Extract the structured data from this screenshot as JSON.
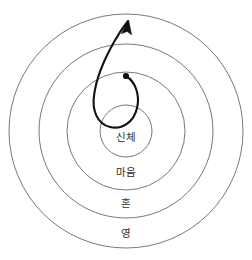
{
  "diagram": {
    "type": "concentric-circles-with-spiral",
    "background_color": "#ffffff",
    "ring_stroke_color": "#787878",
    "spiral_stroke_color": "#111111",
    "label_color": "#2b2b2b",
    "center": {
      "x": 126,
      "y": 131
    },
    "rings": [
      {
        "index": 1,
        "label": "신체",
        "radius": 26,
        "label_x": 126,
        "label_y": 137
      },
      {
        "index": 2,
        "label": "마음",
        "radius": 59,
        "label_x": 126,
        "label_y": 172
      },
      {
        "index": 3,
        "label": "혼",
        "radius": 87,
        "label_x": 126,
        "label_y": 203
      },
      {
        "index": 4,
        "label": "영",
        "radius": 117,
        "label_x": 126,
        "label_y": 233
      }
    ],
    "spiral": {
      "origin_dot": {
        "x": 126,
        "y": 76,
        "radius": 3.1
      },
      "arrow_tip": {
        "x": 128,
        "y": 21
      },
      "direction": "outward",
      "path": "M 126 76 C 136 82 140 96 137 108 C 134 122 122 130 110 127 C 97 124 92 110 94 96 C 96 78 105 58 114 42 C 119 33 124 26 128 21"
    }
  }
}
